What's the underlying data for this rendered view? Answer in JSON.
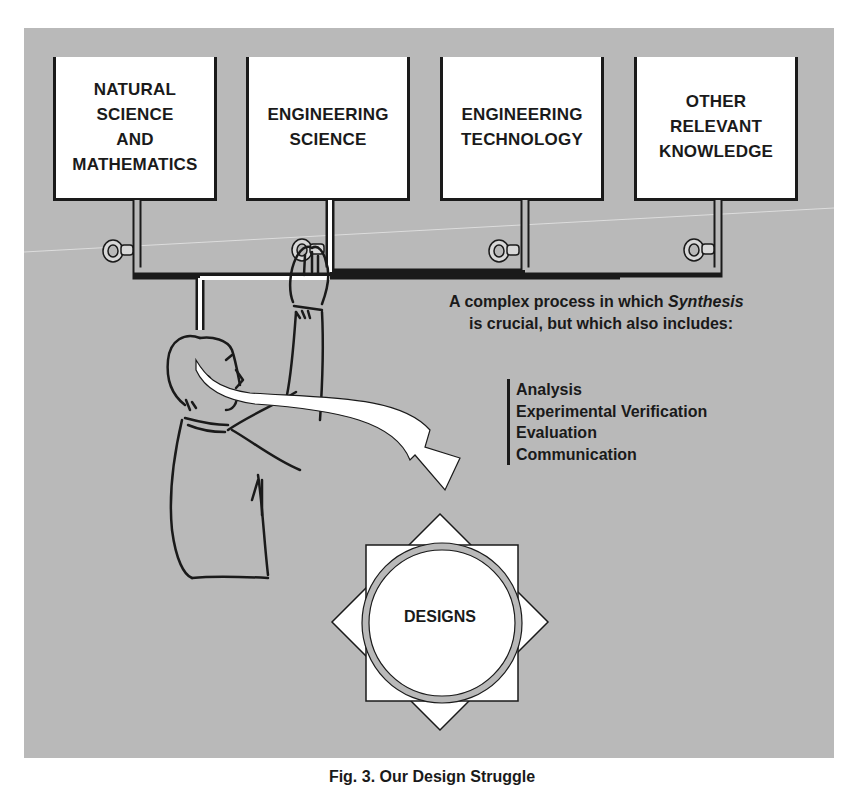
{
  "figure": {
    "caption": "Fig. 3. Our Design Struggle",
    "background_color": "#b9b9b9",
    "knowledge_sources": [
      {
        "label": "NATURAL\nSCIENCE\nAND\nMATHEMATICS"
      },
      {
        "label": "ENGINEERING\nSCIENCE"
      },
      {
        "label": "ENGINEERING\nTECHNOLOGY"
      },
      {
        "label": "OTHER\nRELEVANT\nKNOWLEDGE"
      }
    ],
    "valves": [
      {
        "name": "valve-natural-science"
      },
      {
        "name": "valve-engineering-science"
      },
      {
        "name": "valve-engineering-technology"
      },
      {
        "name": "valve-other-knowledge"
      }
    ],
    "description": {
      "line1_prefix": "A complex process in which ",
      "line1_emphasis": "Synthesis",
      "line2": "is crucial, but which also includes:"
    },
    "process_steps": [
      "Analysis",
      "Experimental Verification",
      "Evaluation",
      "Communication"
    ],
    "output": {
      "label": "DESIGNS"
    }
  }
}
